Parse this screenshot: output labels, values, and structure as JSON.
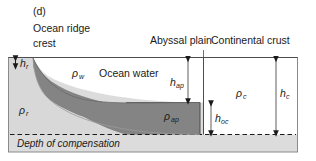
{
  "figure": {
    "panel_tag": "(d)",
    "caption_lines": [
      "Ocean ridge",
      "crest"
    ],
    "column_headers": {
      "abyssal_plain": "Abyssal plain",
      "continental_crust": "Continental crust"
    },
    "region_labels": {
      "ocean_water": "Ocean water",
      "depth_of_compensation": "Depth of compensation"
    },
    "density_symbols": {
      "water": "ρ",
      "water_sub": "w",
      "ridge": "ρ",
      "ridge_sub": "r",
      "abyssal_plain": "ρ",
      "abyssal_plain_sub": "ap",
      "continental_crust": "ρ",
      "continental_crust_sub": "c"
    },
    "height_symbols": {
      "ridge": "h",
      "ridge_sub": "r",
      "abyssal_plain": "h",
      "abyssal_plain_sub": "ap",
      "oceanic_crust": "h",
      "oceanic_crust_sub": "oc",
      "continental_crust": "h",
      "continental_crust_sub": "c"
    },
    "colors": {
      "background": "#ffffff",
      "water_fill": "#ffffff",
      "ridge_light_fill": "#d8d8d8",
      "crust_dark_fill": "#848484",
      "mantle_fill": "#dcdcdc",
      "outline": "#4d4d4d",
      "text": "#1a1a1a",
      "arrow": "#1a1a1a"
    }
  }
}
